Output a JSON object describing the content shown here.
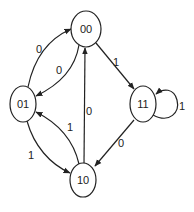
{
  "diagram": {
    "type": "state-transition-diagram",
    "nodes": [
      {
        "id": "00",
        "label": "00",
        "cx": 86,
        "cy": 29,
        "rx": 15,
        "ry": 18
      },
      {
        "id": "01",
        "label": "01",
        "cx": 23,
        "cy": 104,
        "rx": 13,
        "ry": 18
      },
      {
        "id": "11",
        "label": "11",
        "cx": 143,
        "cy": 104,
        "rx": 13,
        "ry": 18
      },
      {
        "id": "10",
        "label": "10",
        "cx": 83,
        "cy": 180,
        "rx": 13,
        "ry": 17
      }
    ],
    "edges": [
      {
        "from": "01",
        "to": "00",
        "label": "0",
        "lx": 38,
        "ly": 53
      },
      {
        "from": "00",
        "to": "01",
        "label": "0",
        "lx": 57,
        "ly": 74
      },
      {
        "from": "00",
        "to": "11",
        "label": "1",
        "lx": 115,
        "ly": 66
      },
      {
        "from": "11",
        "to": "11",
        "label": "1",
        "lx": 180,
        "ly": 110
      },
      {
        "from": "10",
        "to": "00",
        "label": "0",
        "lx": 87,
        "ly": 114
      },
      {
        "from": "10",
        "to": "01",
        "label": "1",
        "lx": 68,
        "ly": 131
      },
      {
        "from": "01",
        "to": "10",
        "label": "1",
        "lx": 29,
        "ly": 159
      },
      {
        "from": "11",
        "to": "10",
        "label": "0",
        "lx": 119,
        "ly": 147
      }
    ]
  }
}
